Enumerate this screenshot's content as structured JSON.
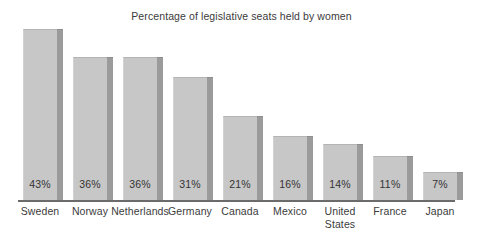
{
  "chart_data": {
    "type": "bar",
    "title": "Percentage of legislative seats held by women",
    "xlabel": "",
    "ylabel": "",
    "ylim": [
      0,
      43
    ],
    "grid": false,
    "legend": "none",
    "orientation": "vertical",
    "value_label_position": "inside-bottom",
    "categories": [
      "Sweden",
      "Norway",
      "Netherlands",
      "Germany",
      "Canada",
      "Mexico",
      "United States",
      "France",
      "Japan"
    ],
    "values": [
      43,
      36,
      36,
      31,
      21,
      16,
      14,
      11,
      7
    ],
    "value_labels": [
      "43%",
      "36%",
      "36%",
      "31%",
      "21%",
      "16%",
      "14%",
      "11%",
      "7%"
    ],
    "category_label_lines": [
      [
        "Sweden"
      ],
      [
        "Norway"
      ],
      [
        "Netherlands"
      ],
      [
        "Germany"
      ],
      [
        "Canada"
      ],
      [
        "Mexico"
      ],
      [
        "United",
        "States"
      ],
      [
        "France"
      ],
      [
        "Japan"
      ]
    ],
    "colors": {
      "bar_face": "#c7c7c7",
      "bar_side": "#9b9b9b",
      "axis": "#6b6b6b",
      "text": "#3b3b3b",
      "background": "#ffffff"
    }
  }
}
